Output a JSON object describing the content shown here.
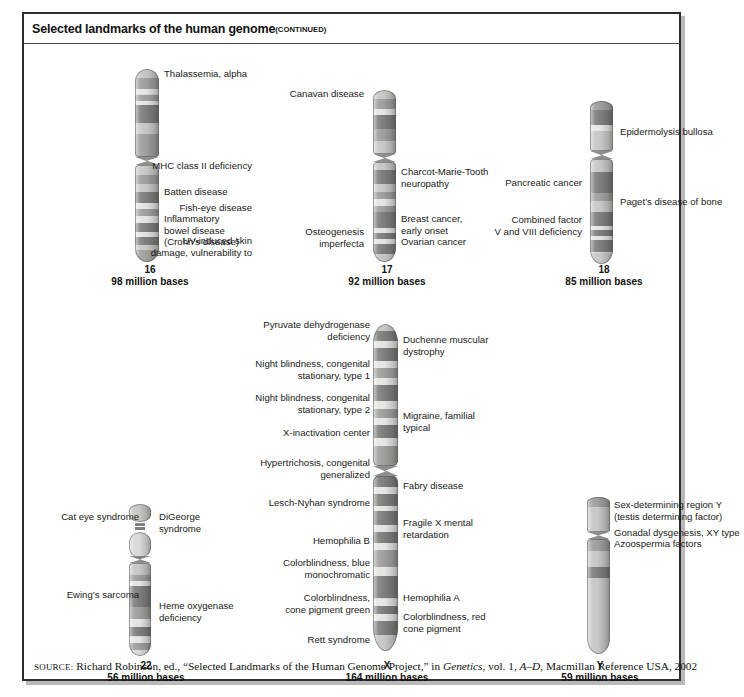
{
  "figure": {
    "title": "Selected landmarks of the human genome",
    "title_continued": "(CONTINUED)",
    "source_prefix": "SOURCE:",
    "source_text_1": " Richard Robinson, ed., “Selected Landmarks of the Human Genome Project,” in ",
    "source_italic_1": "Genetics",
    "source_text_2": ", vol. 1, ",
    "source_italic_2": "A–D",
    "source_text_3": ", Macmillan Reference USA, 2002"
  },
  "chart_data": {
    "type": "diagram",
    "chromosomes": [
      {
        "name": "16",
        "size_label": "98 million bases",
        "size_mb": 98,
        "labels_left": [
          "MHC class II deficiency",
          "Fish-eye disease",
          "UV-induced skin\ndamage, vulnerability to"
        ],
        "labels_right": [
          "Thalassemia, alpha",
          "Batten disease",
          "Inflammatory\nbowel disease\n(Crohn’s disease)"
        ]
      },
      {
        "name": "17",
        "size_label": "92 million bases",
        "size_mb": 92,
        "labels_left": [
          "Canavan disease",
          "Osteogenesis\nimperfecta"
        ],
        "labels_right": [
          "Charcot-Marie-Tooth\nneuropathy",
          "Breast cancer,\nearly onset",
          "Ovarian cancer"
        ]
      },
      {
        "name": "18",
        "size_label": "85 million bases",
        "size_mb": 85,
        "labels_left": [
          "Pancreatic cancer",
          "Combined factor\nV and VIII deficiency"
        ],
        "labels_right": [
          "Epidermolysis bullosa",
          "Paget’s disease of bone"
        ]
      },
      {
        "name": "22",
        "size_label": "56 million bases",
        "size_mb": 56,
        "labels_left": [
          "Cat eye syndrome",
          "Ewing’s sarcoma"
        ],
        "labels_right": [
          "DiGeorge\nsyndrome",
          "Heme oxygenase\ndeficiency"
        ]
      },
      {
        "name": "X",
        "size_label": "164 million bases",
        "size_mb": 164,
        "labels_left": [
          "Pyruvate dehydrogenase\ndeficiency",
          "Night blindness, congenital\nstationary, type 1",
          "Night blindness, congenital\nstationary, type 2",
          "X-inactivation center",
          "Hypertrichosis, congenital\ngeneralized",
          "Lesch-Nyhan syndrome",
          "Hemophilia B",
          "Colorblindness, blue\nmonochromatic",
          "Colorblindness,\ncone pigment green",
          "Rett syndrome"
        ],
        "labels_right": [
          "Duchenne muscular\ndystrophy",
          "Migraine, familial\ntypical",
          "Fabry disease",
          "Fragile X mental\nretardation",
          "Hemophilia A",
          "Colorblindness, red\ncone pigment"
        ]
      },
      {
        "name": "Y",
        "size_label": "59 million bases",
        "size_mb": 59,
        "labels_left": [],
        "labels_right": [
          "Sex-determining region Y\n(testis determining factor)",
          "Gonadal dysgenesis, XY type",
          "Azoospermia factors"
        ]
      }
    ]
  },
  "chr16": {
    "name": "16",
    "size": "98 million bases",
    "l0": "MHC class II deficiency",
    "l1": "Fish-eye disease",
    "l2": "UV-induced skin\ndamage, vulnerability to",
    "r0": "Thalassemia, alpha",
    "r1": "Batten disease",
    "r2": "Inflammatory\nbowel disease\n(Crohn’s disease)"
  },
  "chr17": {
    "name": "17",
    "size": "92 million bases",
    "l0": "Canavan disease",
    "l1": "Osteogenesis\nimperfecta",
    "r0": "Charcot-Marie-Tooth\nneuropathy",
    "r1": "Breast cancer,\nearly onset\nOvarian cancer"
  },
  "chr18": {
    "name": "18",
    "size": "85 million bases",
    "l0": "Pancreatic cancer",
    "l1": "Combined factor\nV and VIII deficiency",
    "r0": "Epidermolysis bullosa",
    "r1": "Paget’s disease of bone"
  },
  "chr22": {
    "name": "22",
    "size": "56 million bases",
    "l0": "Cat eye syndrome",
    "l1": "Ewing’s sarcoma",
    "r0": "DiGeorge\nsyndrome",
    "r1": "Heme oxygenase\ndeficiency"
  },
  "chrX": {
    "name": "X",
    "size": "164 million bases",
    "l0": "Pyruvate dehydrogenase\ndeficiency",
    "l1": "Night blindness, congenital\nstationary, type 1",
    "l2": "Night blindness, congenital\nstationary, type 2",
    "l3": "X-inactivation center",
    "l4": "Hypertrichosis, congenital\ngeneralized",
    "l5": "Lesch-Nyhan syndrome",
    "l6": "Hemophilia B",
    "l7": "Colorblindness, blue\nmonochromatic",
    "l8": "Colorblindness,\ncone pigment green",
    "l9": "Rett syndrome",
    "r0": "Duchenne muscular\ndystrophy",
    "r1": "Migraine, familial\ntypical",
    "r2": "Fabry disease",
    "r3": "Fragile X mental\nretardation",
    "r4": "Hemophilia A",
    "r5": "Colorblindness, red\ncone pigment"
  },
  "chrY": {
    "name": "Y",
    "size": "59 million bases",
    "r0": "Sex-determining region Y\n(testis determining factor)",
    "r1": "Gonadal dysgenesis, XY type",
    "r2": "Azoospermia factors"
  }
}
